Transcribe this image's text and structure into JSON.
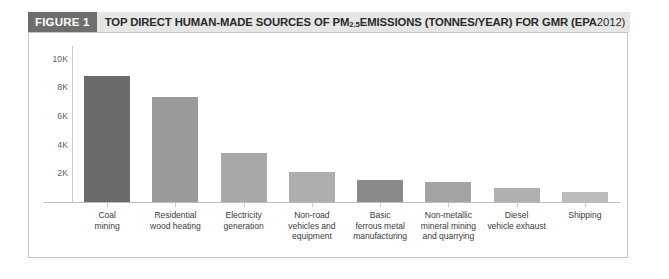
{
  "figure": {
    "tag": "FIGURE 1",
    "title_part1": "TOP DIRECT HUMAN-MADE SOURCES OF PM",
    "title_sub": "2.5",
    "title_part2": " EMISSIONS (TONNES/YEAR) FOR GMR (",
    "title_source": "EPA",
    "title_part3": " 2012)",
    "full_title": "TOP DIRECT HUMAN-MADE SOURCES OF PM2.5 EMISSIONS (TONNES/YEAR) FOR GMR (EPA 2012)"
  },
  "colors": {
    "tag_background": "#6e6e6c",
    "header_background": "#e6e6e4",
    "frame_border": "#c3c3c1",
    "axis": "#c9c9c7",
    "text": "#3c3c3a"
  },
  "chart_data": {
    "type": "bar",
    "title": "TOP DIRECT HUMAN-MADE SOURCES OF PM2.5 EMISSIONS (TONNES/YEAR) FOR GMR (EPA 2012)",
    "xlabel": "",
    "ylabel": "",
    "ylim": [
      0,
      11000
    ],
    "grid": false,
    "legend": "none",
    "ytick_labels": [
      "2K",
      "4K",
      "6K",
      "8K",
      "10K"
    ],
    "ytick_values": [
      2000,
      4000,
      6000,
      8000,
      10000
    ],
    "categories": [
      "Coal mining",
      "Residential wood heating",
      "Electricity generation",
      "Non-road vehicles and equipment",
      "Basic ferrous metal manufacturing",
      "Non-metallic mineral mining and quarrying",
      "Diesel vehicle exhaust",
      "Shipping"
    ],
    "category_lines": [
      [
        "Coal",
        "mining"
      ],
      [
        "Residential",
        "wood heating"
      ],
      [
        "Electricity",
        "generation"
      ],
      [
        "Non-road",
        "vehicles and",
        "equipment"
      ],
      [
        "Basic",
        "ferrous metal",
        "manufacturing"
      ],
      [
        "Non-metallic",
        "mineral mining",
        "and quarrying"
      ],
      [
        "Diesel",
        "vehicle exhaust"
      ],
      [
        "Shipping"
      ]
    ],
    "values": [
      8800,
      7300,
      3450,
      2100,
      1550,
      1380,
      1000,
      700
    ],
    "bar_colors": [
      "#6b6b6b",
      "#9a9a9a",
      "#a8a8a8",
      "#adadad",
      "#8a8a8a",
      "#a3a3a3",
      "#b0b0b0",
      "#bcbcbc"
    ]
  }
}
